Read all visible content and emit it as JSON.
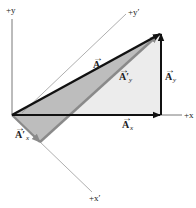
{
  "diagram": {
    "axes": {
      "x": {
        "label": "+x"
      },
      "y": {
        "label": "+y"
      },
      "x_prime": {
        "label": "+x′"
      },
      "y_prime": {
        "label": "+y′"
      }
    },
    "vectors": {
      "A": {
        "symbol": "A",
        "arrow": "→"
      },
      "A_x": {
        "symbol": "A",
        "subscript": "x",
        "arrow": "→"
      },
      "A_y": {
        "symbol": "A",
        "subscript": "y",
        "arrow": "→"
      },
      "A_x_prime": {
        "symbol": "A′",
        "subscript": "x",
        "arrow": "→"
      },
      "A_y_prime": {
        "symbol": "A′",
        "subscript": "y",
        "arrow": "→"
      }
    },
    "colors": {
      "primary_vector": "#111111",
      "prime_vector": "#8a8a8a",
      "prime_axis": "#9a9a9a",
      "light_fill": "#ececec",
      "dark_fill": "#bdbdbd"
    }
  }
}
